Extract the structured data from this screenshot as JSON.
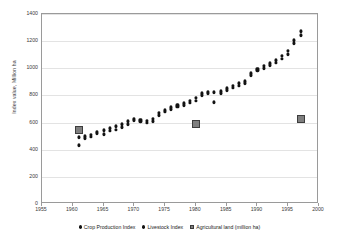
{
  "chart_data": {
    "type": "scatter",
    "title": "",
    "xlabel": "",
    "ylabel": "Index value, Million ha",
    "xlim": [
      1955,
      2000
    ],
    "ylim": [
      0,
      1400
    ],
    "grid": true,
    "legend_position": "bottom",
    "xticks": [
      1955,
      1960,
      1965,
      1970,
      1975,
      1980,
      1985,
      1990,
      1995,
      2000
    ],
    "yticks": [
      0,
      200,
      400,
      600,
      800,
      1000,
      1200,
      1400
    ],
    "series": [
      {
        "name": "Crop Production Index",
        "marker": "dot",
        "color": "#121212",
        "x": [
          1961,
          1962,
          1963,
          1964,
          1965,
          1966,
          1967,
          1968,
          1969,
          1970,
          1971,
          1972,
          1973,
          1974,
          1975,
          1976,
          1977,
          1978,
          1979,
          1980,
          1981,
          1982,
          1983,
          1984,
          1985,
          1986,
          1987,
          1988,
          1989,
          1990,
          1991,
          1992,
          1993,
          1994,
          1995,
          1996,
          1997
        ],
        "values": [
          432,
          487,
          497,
          520,
          515,
          540,
          548,
          565,
          590,
          618,
          612,
          600,
          610,
          655,
          680,
          700,
          718,
          728,
          745,
          762,
          800,
          818,
          750,
          818,
          840,
          858,
          872,
          888,
          948,
          985,
          1000,
          1022,
          1040,
          1070,
          1105,
          1185,
          1245
        ]
      },
      {
        "name": "Livestock Index",
        "marker": "dot",
        "color": "#121212",
        "x": [
          1961,
          1962,
          1963,
          1964,
          1965,
          1966,
          1967,
          1968,
          1969,
          1970,
          1971,
          1972,
          1973,
          1974,
          1975,
          1976,
          1977,
          1978,
          1979,
          1980,
          1981,
          1982,
          1983,
          1984,
          1985,
          1986,
          1987,
          1988,
          1989,
          1990,
          1991,
          1992,
          1993,
          1994,
          1995,
          1996,
          1997
        ],
        "values": [
          492,
          500,
          512,
          532,
          545,
          558,
          572,
          590,
          612,
          628,
          622,
          615,
          628,
          672,
          692,
          712,
          728,
          742,
          760,
          782,
          815,
          828,
          822,
          832,
          855,
          872,
          888,
          905,
          965,
          998,
          1018,
          1038,
          1058,
          1092,
          1130,
          1205,
          1272
        ]
      },
      {
        "name": "Agricultural land (million ha)",
        "marker": "square",
        "color": "#7f7f7f",
        "x": [
          1961,
          1980,
          1997
        ],
        "values": [
          548,
          588,
          625
        ]
      }
    ]
  },
  "legend": {
    "items": [
      {
        "label": "Crop Production Index",
        "marker": "dot"
      },
      {
        "label": "Livestock Index",
        "marker": "dot"
      },
      {
        "label": "Agricultural land (million ha)",
        "marker": "square"
      }
    ]
  }
}
